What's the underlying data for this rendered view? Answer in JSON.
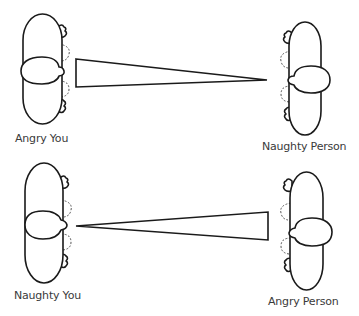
{
  "diagram": {
    "top_scene": {
      "left_figure": {
        "label": "Angry You",
        "facing": "right"
      },
      "right_figure": {
        "label": "Naughty Person",
        "facing": "left"
      },
      "wedge": {
        "wide_end": "left",
        "narrow_end": "right"
      }
    },
    "bottom_scene": {
      "left_figure": {
        "label": "Naughty You",
        "facing": "right"
      },
      "right_figure": {
        "label": "Angry Person",
        "facing": "left"
      },
      "wedge": {
        "wide_end": "right",
        "narrow_end": "left"
      }
    },
    "colors": {
      "line": "#1a1a1a",
      "dashed_line": "#555555",
      "label_text": "#3a3a3a",
      "background": "#ffffff"
    }
  }
}
